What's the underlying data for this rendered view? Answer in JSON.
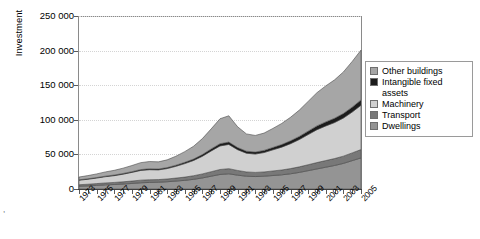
{
  "chart": {
    "type": "area",
    "title": "",
    "ylabel": "Investment",
    "xlabel": ""
  },
  "axes": {
    "y_ticks": [
      "0",
      "50 000",
      "100 000",
      "150 000",
      "200 000",
      "250 000"
    ],
    "y_tick_values": [
      0,
      50000,
      100000,
      150000,
      200000,
      250000
    ],
    "ylim": [
      0,
      250000
    ],
    "x_ticks": [
      "1973",
      "1975",
      "1977",
      "1979",
      "1981",
      "1983",
      "1985",
      "1987",
      "1989",
      "1991",
      "1993",
      "1995",
      "1997",
      "1999",
      "2001",
      "2003",
      "2005"
    ],
    "grid": "horizontal-dotted"
  },
  "legend": {
    "position": "right",
    "items": [
      {
        "label": "Other buildings",
        "color": "#a6a6a6"
      },
      {
        "label": "Intangible fixed",
        "label2": "assets",
        "color": "#1c1c1c"
      },
      {
        "label": "Machinery",
        "color": "#d0d0d0"
      },
      {
        "label": "Transport",
        "color": "#787878"
      },
      {
        "label": "Dwellings",
        "color": "#949494"
      }
    ]
  },
  "artifact": {
    "text": ","
  },
  "chart_data": {
    "type": "area",
    "stacked": true,
    "title": "",
    "xlabel": "",
    "ylabel": "Investment",
    "ylim": [
      0,
      250000
    ],
    "grid": true,
    "legend_position": "right",
    "x": [
      1973,
      1974,
      1975,
      1976,
      1977,
      1978,
      1979,
      1980,
      1981,
      1982,
      1983,
      1984,
      1985,
      1986,
      1987,
      1988,
      1989,
      1990,
      1991,
      1992,
      1993,
      1994,
      1995,
      1996,
      1997,
      1998,
      1999,
      2000,
      2001,
      2002,
      2003,
      2004,
      2005
    ],
    "categories": [
      "1973",
      "1974",
      "1975",
      "1976",
      "1977",
      "1978",
      "1979",
      "1980",
      "1981",
      "1982",
      "1983",
      "1984",
      "1985",
      "1986",
      "1987",
      "1988",
      "1989",
      "1990",
      "1991",
      "1992",
      "1993",
      "1994",
      "1995",
      "1996",
      "1997",
      "1998",
      "1999",
      "2000",
      "2001",
      "2002",
      "2003",
      "2004",
      "2005"
    ],
    "series": [
      {
        "name": "Dwellings",
        "color": "#949494",
        "values": [
          4000,
          4500,
          5200,
          6000,
          6500,
          7200,
          8000,
          9000,
          9500,
          9800,
          10500,
          11500,
          12500,
          14000,
          16000,
          18500,
          21000,
          22000,
          20000,
          18500,
          18000,
          18500,
          19500,
          20500,
          22000,
          24000,
          26500,
          29000,
          31500,
          34000,
          37000,
          41000,
          45000
        ]
      },
      {
        "name": "Transport",
        "color": "#787878",
        "values": [
          2200,
          2400,
          2600,
          2800,
          3000,
          3200,
          3500,
          3800,
          3900,
          3800,
          4000,
          4300,
          4700,
          5200,
          5800,
          6500,
          7200,
          7400,
          6800,
          6200,
          6000,
          6200,
          6600,
          7000,
          7500,
          8000,
          8600,
          9200,
          9600,
          10000,
          10500,
          11200,
          12000
        ]
      },
      {
        "name": "Machinery",
        "color": "#d0d0d0",
        "values": [
          6500,
          7200,
          8000,
          9000,
          9800,
          11000,
          12500,
          14000,
          14500,
          14000,
          15000,
          17000,
          19500,
          22000,
          25500,
          30000,
          34000,
          35000,
          30000,
          27000,
          26500,
          28000,
          30500,
          33000,
          36000,
          39500,
          43500,
          47500,
          50000,
          52000,
          55000,
          59000,
          64000
        ]
      },
      {
        "name": "Intangible fixed assets",
        "color": "#1c1c1c",
        "values": [
          600,
          650,
          700,
          800,
          900,
          1000,
          1100,
          1250,
          1300,
          1300,
          1400,
          1600,
          1800,
          2100,
          2500,
          2900,
          3300,
          3400,
          3100,
          2900,
          2900,
          3100,
          3400,
          3700,
          4100,
          4500,
          5000,
          5500,
          5900,
          6200,
          6600,
          7100,
          7700
        ]
      },
      {
        "name": "Other buildings",
        "color": "#a6a6a6",
        "values": [
          4000,
          4600,
          5300,
          6100,
          6800,
          7700,
          8800,
          10000,
          10500,
          10300,
          11200,
          13000,
          15500,
          18500,
          23000,
          29000,
          36000,
          38000,
          30000,
          25000,
          24000,
          25000,
          27500,
          30500,
          34000,
          38000,
          43000,
          48000,
          52000,
          55500,
          60000,
          66000,
          72000
        ]
      }
    ],
    "totals": [
      17300,
      19350,
      21800,
      24700,
      27000,
      30100,
      33900,
      38050,
      39700,
      39200,
      42100,
      47400,
      54000,
      61800,
      72800,
      86900,
      101500,
      105800,
      89900,
      79600,
      77400,
      80800,
      87500,
      94700,
      103600,
      114000,
      126600,
      139200,
      149000,
      157700,
      169100,
      184300,
      200700
    ]
  }
}
